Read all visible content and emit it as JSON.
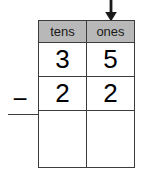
{
  "worksheet": {
    "type": "place-value-subtraction",
    "operator": "−",
    "annotation": {
      "icon": "down-arrow-icon",
      "points_to": "ones"
    },
    "columns": [
      {
        "key": "tens",
        "label": "tens"
      },
      {
        "key": "ones",
        "label": "ones"
      }
    ],
    "rows": [
      {
        "role": "minuend",
        "tens": "3",
        "ones": "5"
      },
      {
        "role": "subtrahend",
        "tens": "2",
        "ones": "2"
      },
      {
        "role": "difference",
        "tens": "",
        "ones": ""
      }
    ],
    "colors": {
      "header_background": "#b8b8b8",
      "border": "#3c3c3c",
      "cell_background": "#ffffff",
      "text": "#000000",
      "page_background": "#ffffff"
    }
  }
}
